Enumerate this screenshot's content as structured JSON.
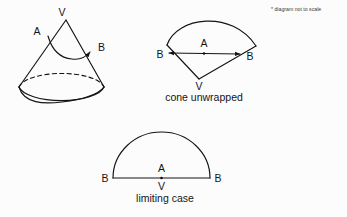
{
  "figure": {
    "note": "* diagram not to scale",
    "background_color": "#fcfcfc",
    "ink_color": "#141414",
    "panels": [
      {
        "id": "cone-3d",
        "caption": "",
        "labels": {
          "vertex": "V",
          "point_a": "A",
          "point_b": "B"
        },
        "description": "three-dimensional cone with geodesic path from A to B"
      },
      {
        "id": "cone-unwrapped",
        "caption": "cone unwrapped",
        "labels": {
          "vertex": "V",
          "point_a": "A",
          "point_b_left": "B",
          "point_b_right": "B"
        },
        "description": "circular sector with apex V at bottom, arc at top, straight chord from B to B through A"
      },
      {
        "id": "limiting-case",
        "caption": "limiting case",
        "labels": {
          "vertex": "V",
          "point_a": "A",
          "point_b_left": "B",
          "point_b_right": "B"
        },
        "description": "semicircle with diameter from B to B, A above the centre, V below the centre"
      }
    ]
  }
}
